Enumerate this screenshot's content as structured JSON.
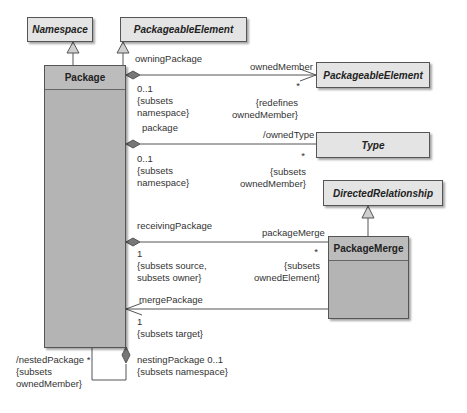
{
  "classes": {
    "namespace": "Namespace",
    "packageable_element_top": "PackageableElement",
    "package": "Package",
    "packageable_element_right": "PackageableElement",
    "type": "Type",
    "directed_relationship": "DirectedRelationship",
    "package_merge": "PackageMerge"
  },
  "associations": {
    "owned_member": {
      "source_role": "owningPackage",
      "source_multiplicity": "0..1\n{subsets\nnamespace}",
      "target_role": "ownedMember",
      "target_multiplicity": "*",
      "target_constraint": "{redefines\nownedMember}"
    },
    "owned_type": {
      "source_role": "package",
      "source_multiplicity": "0..1\n{subsets\nnamespace}",
      "target_role": "/ownedType",
      "target_multiplicity": "*",
      "target_constraint": "{subsets\nownedMember}"
    },
    "package_merge": {
      "source_role": "receivingPackage",
      "source_multiplicity": "1\n{subsets source,\nsubsets owner}",
      "target_role": "packageMerge",
      "target_multiplicity": "*",
      "target_constraint": "{subsets\nownedElement}"
    },
    "merge_package": {
      "target_role": "mergePackage",
      "target_multiplicity": "1\n{subsets target}"
    },
    "nested_package": {
      "role": "/nestedPackage *\n{subsets\nownedMember}",
      "opposite_role": "nestingPackage 0..1\n{subsets namespace}"
    }
  },
  "colors": {
    "abstract_fill": "#e4e4e4",
    "class_fill": "#b4b4b4",
    "line": "#555555"
  }
}
